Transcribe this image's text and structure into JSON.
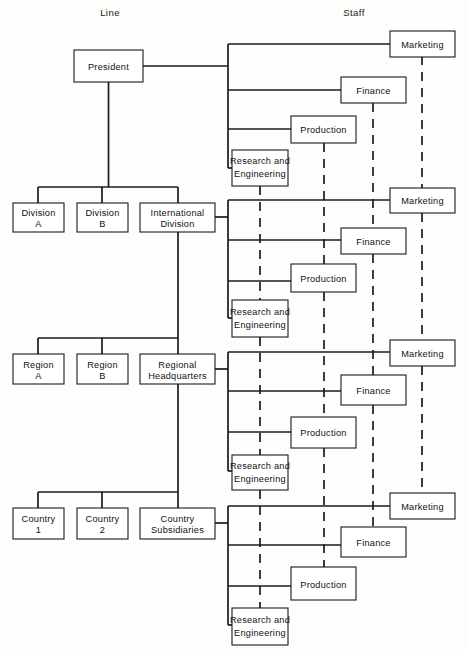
{
  "diagram": {
    "headers": {
      "line": "Line",
      "staff": "Staff"
    },
    "colors": {
      "ink": "#1b1b1b",
      "box_fill": "#ffffff",
      "background": "#fdfdfc"
    },
    "line_boxes": [
      {
        "id": "president",
        "label_1": "President",
        "label_2": ""
      },
      {
        "id": "division-a",
        "label_1": "Division",
        "label_2": "A"
      },
      {
        "id": "division-b",
        "label_1": "Division",
        "label_2": "B"
      },
      {
        "id": "international-division",
        "label_1": "International",
        "label_2": "Division"
      },
      {
        "id": "region-a",
        "label_1": "Region",
        "label_2": "A"
      },
      {
        "id": "region-b",
        "label_1": "Region",
        "label_2": "B"
      },
      {
        "id": "regional-headquarters",
        "label_1": "Regional",
        "label_2": "Headquarters"
      },
      {
        "id": "country-1",
        "label_1": "Country",
        "label_2": "1"
      },
      {
        "id": "country-2",
        "label_1": "Country",
        "label_2": "2"
      },
      {
        "id": "country-subsidiaries",
        "label_1": "Country",
        "label_2": "Subsidiaries"
      }
    ],
    "staff_clusters": [
      {
        "id": "corporate-staff",
        "reports_to": "President",
        "boxes": [
          {
            "id": "marketing-1",
            "label_1": "Marketing",
            "label_2": ""
          },
          {
            "id": "finance-1",
            "label_1": "Finance",
            "label_2": ""
          },
          {
            "id": "production-1",
            "label_1": "Production",
            "label_2": ""
          },
          {
            "id": "research-engineering-1",
            "label_1": "Research and",
            "label_2": "Engineering"
          }
        ]
      },
      {
        "id": "international-division-staff",
        "reports_to": "International Division",
        "boxes": [
          {
            "id": "marketing-2",
            "label_1": "Marketing",
            "label_2": ""
          },
          {
            "id": "finance-2",
            "label_1": "Finance",
            "label_2": ""
          },
          {
            "id": "production-2",
            "label_1": "Production",
            "label_2": ""
          },
          {
            "id": "research-engineering-2",
            "label_1": "Research and",
            "label_2": "Engineering"
          }
        ]
      },
      {
        "id": "regional-headquarters-staff",
        "reports_to": "Regional Headquarters",
        "boxes": [
          {
            "id": "marketing-3",
            "label_1": "Marketing",
            "label_2": ""
          },
          {
            "id": "finance-3",
            "label_1": "Finance",
            "label_2": ""
          },
          {
            "id": "production-3",
            "label_1": "Production",
            "label_2": ""
          },
          {
            "id": "research-engineering-3",
            "label_1": "Research and",
            "label_2": "Engineering"
          }
        ]
      },
      {
        "id": "country-subsidiaries-staff",
        "reports_to": "Country Subsidiaries",
        "boxes": [
          {
            "id": "marketing-4",
            "label_1": "Marketing",
            "label_2": ""
          },
          {
            "id": "finance-4",
            "label_1": "Finance",
            "label_2": ""
          },
          {
            "id": "production-4",
            "label_1": "Production",
            "label_2": ""
          },
          {
            "id": "research-engineering-4",
            "label_1": "Research and",
            "label_2": "Engineering"
          }
        ]
      }
    ],
    "functional_dashed_links": [
      {
        "id": "marketing-chain",
        "function": "Marketing"
      },
      {
        "id": "finance-chain",
        "function": "Finance"
      },
      {
        "id": "production-chain",
        "function": "Production"
      },
      {
        "id": "research-engineering-chain",
        "function": "Research and Engineering"
      }
    ]
  }
}
